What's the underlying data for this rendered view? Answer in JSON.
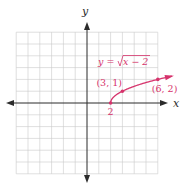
{
  "chart_data": {
    "type": "line",
    "title": "",
    "xlabel": "x",
    "ylabel": "y",
    "xlim": [
      -6,
      6
    ],
    "ylim": [
      -6,
      6
    ],
    "grid": true,
    "grid_step": 1,
    "series": [
      {
        "name": "y = √(x − 2)",
        "function": "sqrt(x-2)",
        "domain": [
          2,
          7.2
        ],
        "color": "#d6336c",
        "start_point": [
          2,
          0
        ],
        "end_arrow": true
      }
    ],
    "points": [
      {
        "x": 2,
        "y": 0,
        "label": "2"
      },
      {
        "x": 3,
        "y": 1,
        "label": "(3, 1)"
      },
      {
        "x": 6,
        "y": 2,
        "label": "(6, 2)"
      }
    ],
    "equation_label": {
      "lhs": "y = ",
      "radicand": "x − 2"
    }
  }
}
